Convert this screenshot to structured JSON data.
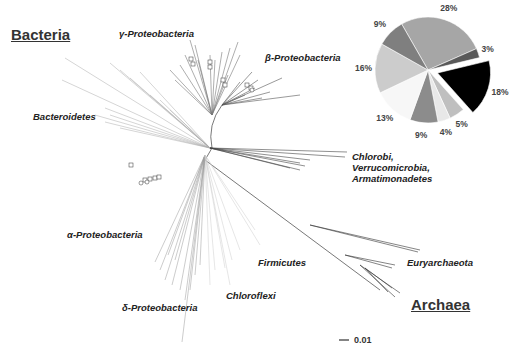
{
  "figure": {
    "domains": {
      "bacteria": "Bacteria",
      "archaea": "Archaea"
    },
    "clades": {
      "gamma": "γ-Proteobacteria",
      "beta": "β-Proteobacteria",
      "bacteroidetes": "Bacteroidetes",
      "chlorobi_1": "Chlorobi,",
      "chlorobi_2": "Verrucomicrobia,",
      "chlorobi_3": "Armatimonadetes",
      "alpha": "α-Proteobacteria",
      "firmicutes": "Firmicutes",
      "chloroflexi": "Chloroflexi",
      "delta": "δ-Proteobacteria",
      "euryarchaeota": "Euryarchaeota"
    },
    "scale_bar": "0.01"
  },
  "chart_data": {
    "type": "pie",
    "title": "",
    "labels": [
      "28%",
      "3%",
      "18%",
      "5%",
      "4%",
      "9%",
      "13%",
      "16%",
      "9%"
    ],
    "values": [
      28,
      3,
      18,
      5,
      4,
      9,
      13,
      16,
      9
    ],
    "colors": [
      "#a6a6a6",
      "#595959",
      "#000000",
      "#bfbfbf",
      "#e8e8e8",
      "#8c8c8c",
      "#f7f7f7",
      "#cccccc",
      "#7f7f7f"
    ],
    "exploded_slice_index": 2,
    "start_angle_deg": 0,
    "direction": "clockwise",
    "legend": "none"
  }
}
